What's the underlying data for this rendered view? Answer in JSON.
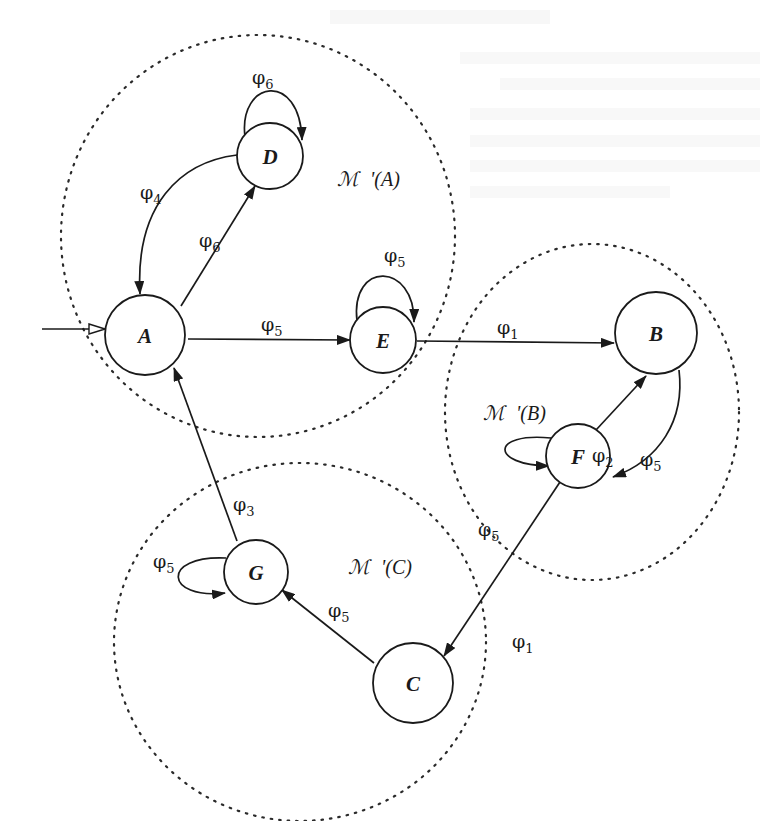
{
  "diagram": {
    "nodes": [
      {
        "id": "A",
        "label": "A",
        "cx": 145,
        "cy": 335,
        "r": 40,
        "initial": true
      },
      {
        "id": "D",
        "label": "D",
        "cx": 270,
        "cy": 156,
        "r": 33
      },
      {
        "id": "E",
        "label": "E",
        "cx": 383,
        "cy": 340,
        "r": 33
      },
      {
        "id": "B",
        "label": "B",
        "cx": 656,
        "cy": 333,
        "r": 41
      },
      {
        "id": "F",
        "label": "F",
        "cx": 578,
        "cy": 456,
        "r": 32
      },
      {
        "id": "G",
        "label": "G",
        "cx": 256,
        "cy": 572,
        "r": 32
      },
      {
        "id": "C",
        "label": "C",
        "cx": 413,
        "cy": 683,
        "r": 40
      }
    ],
    "edges": [
      {
        "from": "D",
        "to": "D",
        "label": "φ",
        "sub": "6"
      },
      {
        "from": "D",
        "to": "A",
        "label": "φ",
        "sub": "4"
      },
      {
        "from": "A",
        "to": "D",
        "label": "φ",
        "sub": "6"
      },
      {
        "from": "A",
        "to": "E",
        "label": "φ",
        "sub": "5"
      },
      {
        "from": "E",
        "to": "E",
        "label": "φ",
        "sub": "5"
      },
      {
        "from": "E",
        "to": "B",
        "label": "φ",
        "sub": "1"
      },
      {
        "from": "F",
        "to": "B",
        "label": "φ",
        "sub": "2"
      },
      {
        "from": "B",
        "to": "F",
        "label": "φ",
        "sub": "5"
      },
      {
        "from": "F",
        "to": "F",
        "label": "φ",
        "sub": "5"
      },
      {
        "from": "F",
        "to": "C",
        "label": "φ",
        "sub": "1"
      },
      {
        "from": "C",
        "to": "G",
        "label": "φ",
        "sub": "5"
      },
      {
        "from": "G",
        "to": "G",
        "label": "φ",
        "sub": "5"
      },
      {
        "from": "G",
        "to": "A",
        "label": "φ",
        "sub": "3"
      }
    ],
    "regions": [
      {
        "id": "MA",
        "script": "ℳ",
        "suffix": "'(A)"
      },
      {
        "id": "MB",
        "script": "ℳ",
        "suffix": "'(B)"
      },
      {
        "id": "MC",
        "script": "ℳ",
        "suffix": "'(C)"
      }
    ]
  }
}
